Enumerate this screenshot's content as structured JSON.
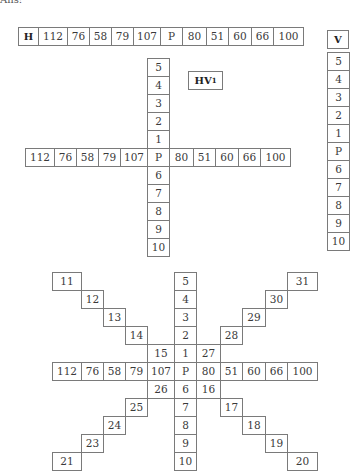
{
  "header": {
    "text": "Ans:"
  },
  "h_row": {
    "label": "H",
    "cells": [
      "112",
      "76",
      "58",
      "79",
      "107",
      "P",
      "80",
      "51",
      "60",
      "66",
      "100"
    ]
  },
  "v_col": {
    "label": "V",
    "cells": [
      "5",
      "4",
      "3",
      "2",
      "1",
      "P",
      "6",
      "7",
      "8",
      "9",
      "10"
    ]
  },
  "hv1": {
    "label": "HV",
    "label_sub": "1",
    "vertical": [
      "5",
      "4",
      "3",
      "2",
      "1",
      "P",
      "6",
      "7",
      "8",
      "9",
      "10"
    ],
    "horizontal_left": [
      "112",
      "76",
      "58",
      "79",
      "107"
    ],
    "horizontal_right": [
      "80",
      "51",
      "60",
      "66",
      "100"
    ]
  },
  "star": {
    "vertical": [
      "5",
      "4",
      "3",
      "2",
      "1",
      "P",
      "6",
      "7",
      "8",
      "9",
      "10"
    ],
    "horizontal_left": [
      "112",
      "76",
      "58",
      "79",
      "107"
    ],
    "horizontal_right": [
      "80",
      "51",
      "60",
      "66",
      "100"
    ],
    "diag_up_left": [
      "11",
      "12",
      "13",
      "14",
      "15"
    ],
    "diag_down_right": [
      "16",
      "17",
      "18",
      "19",
      "20"
    ],
    "diag_down_left": [
      "26",
      "25",
      "24",
      "23",
      "21"
    ],
    "diag_up_right": [
      "27",
      "28",
      "29",
      "30",
      "31"
    ]
  }
}
